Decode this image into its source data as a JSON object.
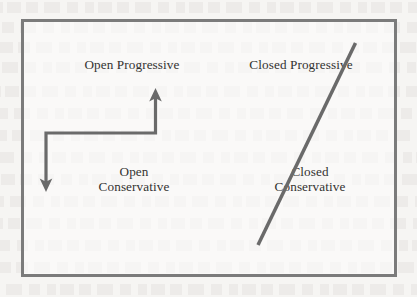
{
  "figure": {
    "type": "quadrant-diagram",
    "background_color": "#f6f5f3",
    "border_color": "#7b7b7b",
    "arrow_color": "#6a6a6a",
    "text_color": "#333231",
    "quadrants": [
      {
        "id": "open-progressive",
        "line1": "Open Progressive",
        "line2": "",
        "position": "top-left"
      },
      {
        "id": "closed-progressive",
        "line1": "Closed Progressive",
        "line2": "",
        "position": "top-right"
      },
      {
        "id": "open-conservative",
        "line1": "Open",
        "line2": "Conservative",
        "position": "bottom-left"
      },
      {
        "id": "closed-conservative",
        "line1": "Closed",
        "line2": "Conservative",
        "position": "bottom-right"
      }
    ],
    "annotations": [
      {
        "id": "elbow-double-arrow",
        "shape": "l-shaped-double-headed-arrow",
        "from": "open-conservative",
        "to": "open-progressive",
        "heads": "both"
      },
      {
        "id": "diagonal-line",
        "shape": "diagonal-line",
        "from": "closed-conservative",
        "to": "closed-progressive",
        "heads": "none"
      }
    ]
  }
}
